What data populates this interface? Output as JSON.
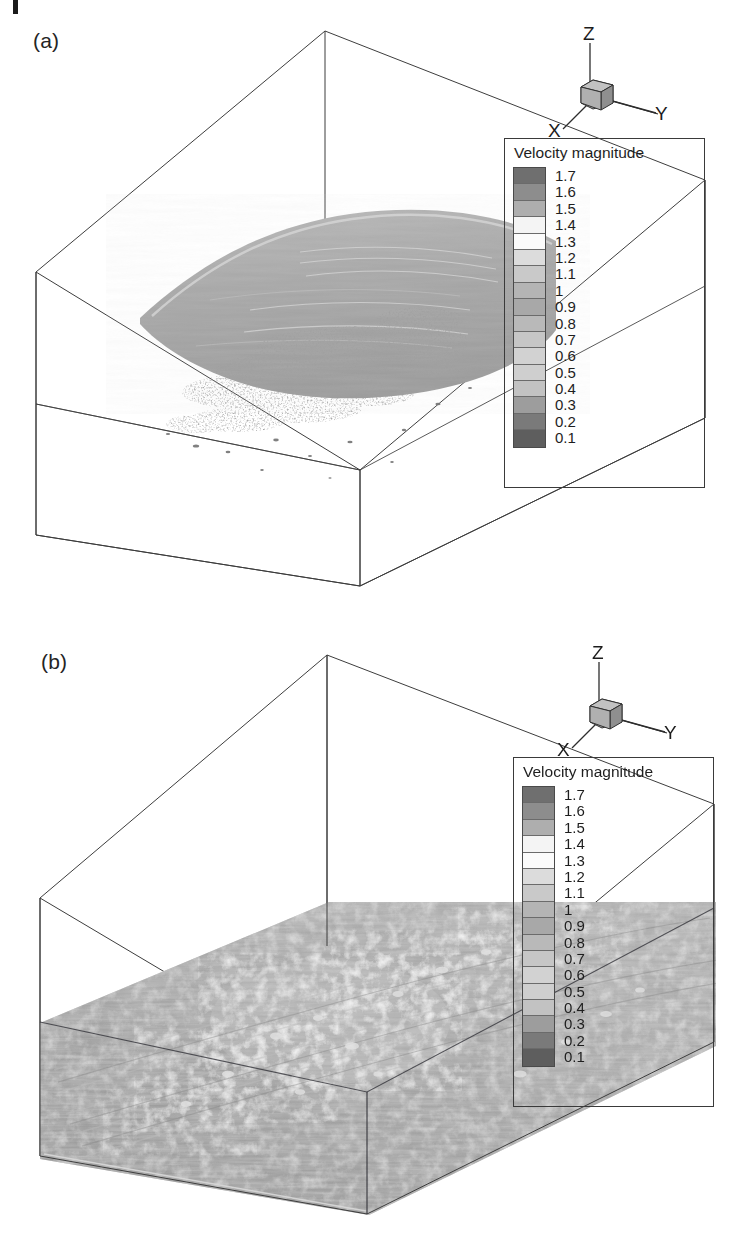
{
  "figure": {
    "type": "scientific-figure",
    "background_color": "#ffffff"
  },
  "panels": [
    {
      "id": "a",
      "label": "(a)",
      "isosurface_state": "curved smooth sheet elevated in upper half of domain with scattered fragmented structures below",
      "legend": {
        "title": "Velocity magnitude",
        "labels": [
          "1.7",
          "1.6",
          "1.5",
          "1.4",
          "1.3",
          "1.2",
          "1.1",
          "1",
          "0.9",
          "0.8",
          "0.7",
          "0.6",
          "0.5",
          "0.4",
          "0.3",
          "0.2",
          "0.1"
        ],
        "colors": [
          "#6f6f6f",
          "#8d8d8d",
          "#aeaeae",
          "#f4f4f4",
          "#fbfbfb",
          "#dcdcdc",
          "#c9c9c9",
          "#b4b4b4",
          "#a8a8a8",
          "#b9b9b9",
          "#c6c6c6",
          "#d2d2d2",
          "#cfcfcf",
          "#c2c2c2",
          "#9d9d9d",
          "#7a7a7a",
          "#5e5e5e"
        ]
      },
      "axis_triad": {
        "z_label": "Z",
        "y_label": "Y",
        "x_label": "X",
        "cube_color": "#a9a9a9"
      }
    },
    {
      "id": "b",
      "label": "(b)",
      "isosurface_state": "fully turbulent rough surface lying on the domain floor with streamwise streaks",
      "legend": {
        "title": "Velocity magnitude",
        "labels": [
          "1.7",
          "1.6",
          "1.5",
          "1.4",
          "1.3",
          "1.2",
          "1.1",
          "1",
          "0.9",
          "0.8",
          "0.7",
          "0.6",
          "0.5",
          "0.4",
          "0.3",
          "0.2",
          "0.1"
        ],
        "colors": [
          "#6f6f6f",
          "#8d8d8d",
          "#aeaeae",
          "#f4f4f4",
          "#fbfbfb",
          "#dcdcdc",
          "#c9c9c9",
          "#b4b4b4",
          "#a8a8a8",
          "#b9b9b9",
          "#c6c6c6",
          "#d2d2d2",
          "#cfcfcf",
          "#c2c2c2",
          "#9d9d9d",
          "#7a7a7a",
          "#5e5e5e"
        ]
      },
      "axis_triad": {
        "z_label": "Z",
        "y_label": "Y",
        "x_label": "X",
        "cube_color": "#a9a9a9"
      }
    }
  ],
  "chart_data": {
    "type": "heatmap",
    "colorbar_label": "Velocity magnitude",
    "colorbar_ticks": [
      1.7,
      1.6,
      1.5,
      1.4,
      1.3,
      1.2,
      1.1,
      1.0,
      0.9,
      0.8,
      0.7,
      0.6,
      0.5,
      0.4,
      0.3,
      0.2,
      0.1
    ],
    "colorbar_range": [
      0.1,
      1.7
    ],
    "band_count": 17,
    "series": [
      {
        "name": "(a)",
        "values": [
          1.7,
          1.6,
          1.5,
          1.4,
          1.3,
          1.2,
          1.1,
          1.0,
          0.9,
          0.8,
          0.7,
          0.6,
          0.5,
          0.4,
          0.3,
          0.2,
          0.1
        ]
      },
      {
        "name": "(b)",
        "values": [
          1.7,
          1.6,
          1.5,
          1.4,
          1.3,
          1.2,
          1.1,
          1.0,
          0.9,
          0.8,
          0.7,
          0.6,
          0.5,
          0.4,
          0.3,
          0.2,
          0.1
        ]
      }
    ],
    "xlabel": "Y",
    "ylabel": "Z",
    "zlabel": "X",
    "grid": false,
    "legend_position": "right"
  }
}
